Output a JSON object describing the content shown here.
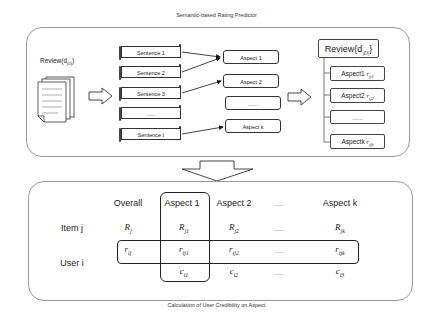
{
  "top_title": "Semantic-based Rating Predictor",
  "bottom_title": "Calculation of User Credibility on Aspect",
  "predictor": {
    "review_label": "Review(d",
    "review_sub": "|D|",
    "review_close": ")",
    "sentences": [
      "Sentence 1",
      "Sentence 2",
      "Sentence 3",
      "......",
      "Sentence t"
    ],
    "aspects": [
      "Aspect 1",
      "Aspect 2",
      "......",
      "Aspect k"
    ],
    "result_title": "Review{d",
    "result_sub": "|D|",
    "result_close": "}",
    "results": [
      {
        "label": "Aspect1",
        "var": "r",
        "sub": "ij1"
      },
      {
        "label": "Aspect2",
        "var": "r",
        "sub": "ij2"
      },
      {
        "label": "......",
        "var": "",
        "sub": ""
      },
      {
        "label": "Aspectk",
        "var": "r",
        "sub": "ijk"
      }
    ]
  },
  "credibility": {
    "columns": [
      "Overall",
      "Aspect 1",
      "Aspect 2",
      "......",
      "Aspect k"
    ],
    "rows": [
      {
        "label": "Item j",
        "cells": [
          {
            "var": "R",
            "sub": "j"
          },
          {
            "var": "R",
            "sub": "j1"
          },
          {
            "var": "R",
            "sub": "j2"
          },
          {
            "var": "......",
            "sub": ""
          },
          {
            "var": "R",
            "sub": "jk"
          }
        ]
      },
      {
        "label": "User i",
        "cells": [
          {
            "var": "r",
            "sub": "ij"
          },
          {
            "var": "r",
            "sub": "ij1"
          },
          {
            "var": "r",
            "sub": "ij2"
          },
          {
            "var": "......",
            "sub": ""
          },
          {
            "var": "r",
            "sub": "ijk"
          }
        ]
      },
      {
        "label": "",
        "cells": [
          {
            "var": "",
            "sub": ""
          },
          {
            "var": "c",
            "sub": "i1"
          },
          {
            "var": "c",
            "sub": "i2"
          },
          {
            "var": "......",
            "sub": ""
          },
          {
            "var": "c",
            "sub": "i3"
          }
        ]
      }
    ]
  }
}
